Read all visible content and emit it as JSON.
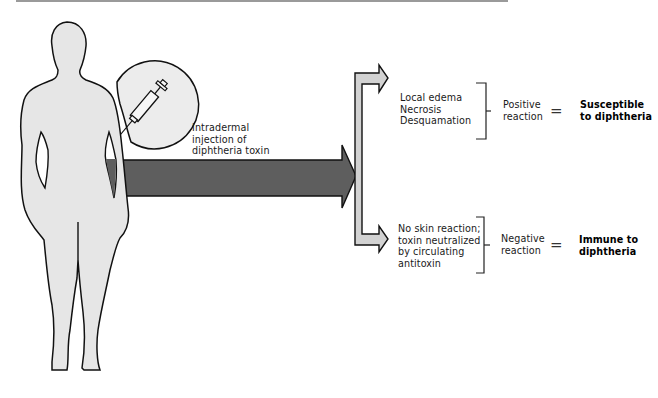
{
  "figure": {
    "injection_label": [
      "Intradermal",
      "injection of",
      "diphtheria toxin"
    ],
    "colors": {
      "body_fill": "#e6e6e6",
      "outline": "#111111",
      "main_arrow": "#5e5e5e",
      "branch_arrow": "#d2d2d2",
      "circle_fill": "#ececec"
    },
    "outcomes": [
      {
        "finding_lines": [
          "Local edema",
          "Necrosis",
          "Desquamation"
        ],
        "reaction_lines": [
          "Positive",
          "reaction"
        ],
        "equals": "=",
        "result_lines": [
          "Susceptible",
          "to diphtheria"
        ]
      },
      {
        "finding_lines": [
          "No skin reaction;",
          "toxin neutralized",
          "by circulating",
          "antitoxin"
        ],
        "reaction_lines": [
          "Negative",
          "reaction"
        ],
        "equals": "=",
        "result_lines": [
          "Immune to",
          "diphtheria"
        ]
      }
    ]
  }
}
